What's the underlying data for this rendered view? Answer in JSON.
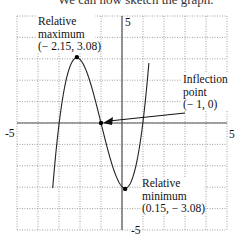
{
  "caption": "We can now sketch the graph.",
  "chart_data": {
    "type": "line",
    "title": "",
    "xlabel": "",
    "ylabel": "",
    "xlim": [
      -5,
      5
    ],
    "ylim": [
      -5,
      5
    ],
    "grid": true,
    "x_tick_labels": [
      "-5",
      "5"
    ],
    "y_tick_labels": [
      "5",
      "-5"
    ],
    "function": "f(x) = (x+1)^3 - 3.9675(x+1)",
    "series": [
      {
        "name": "f(x)",
        "x": [
          -3.2,
          -3,
          -2.5,
          -2.15,
          -2,
          -1.5,
          -1,
          -0.5,
          0,
          0.15,
          0.5,
          1,
          1.2
        ],
        "y": [
          -1.92,
          -0.07,
          2.58,
          3.04,
          2.97,
          1.86,
          0,
          -1.86,
          -2.97,
          -3.04,
          -2.58,
          -0.07,
          1.92
        ]
      }
    ],
    "points": [
      {
        "name": "relative-maximum",
        "x": -2.15,
        "y": 3.08
      },
      {
        "name": "inflection-point",
        "x": -1,
        "y": 0
      },
      {
        "name": "relative-minimum",
        "x": 0.15,
        "y": -3.08
      }
    ],
    "annotations": [
      {
        "id": "max",
        "lines": [
          "Relative",
          "maximum",
          "(− 2.15, 3.08)"
        ]
      },
      {
        "id": "inflection",
        "lines": [
          "Inflection",
          "point",
          "(− 1, 0)"
        ]
      },
      {
        "id": "min",
        "lines": [
          "Relative",
          "minimum",
          "(0.15, − 3.08)"
        ]
      }
    ]
  }
}
